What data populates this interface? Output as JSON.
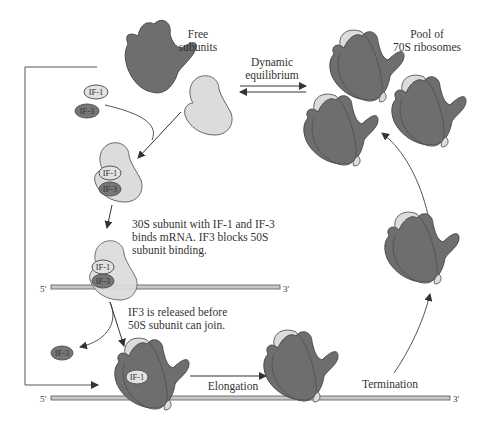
{
  "colors": {
    "large_subunit": "#6e6e6e",
    "small_subunit": "#dcdcdc",
    "if1_fill": "#e2e2e2",
    "if3_fill": "#777777",
    "mrna_fill": "#c8c8c8",
    "line": "#555555",
    "text": "#333333"
  },
  "labels": {
    "free_subunits_line1": "Free",
    "free_subunits_line2": "subunits",
    "equilibrium_line1": "Dynamic",
    "equilibrium_line2": "equilibrium",
    "pool_line1": "Pool of",
    "pool_line2": "70S ribosomes",
    "step1_line1": "30S subunit with IF-1 and IF-3",
    "step1_line2": "binds mRNA. IF3 blocks 50S",
    "step1_line3": "subunit binding.",
    "step2_line1": "IF3 is released before",
    "step2_line2": "50S subunit can join.",
    "elongation": "Elongation",
    "termination": "Termination"
  },
  "factors": {
    "if1": "IF-1",
    "if3": "IF-3"
  },
  "mrna": {
    "upper": {
      "five_prime": "5'",
      "three_prime": "3'"
    },
    "lower": {
      "five_prime": "5'",
      "three_prime": "3'"
    }
  }
}
